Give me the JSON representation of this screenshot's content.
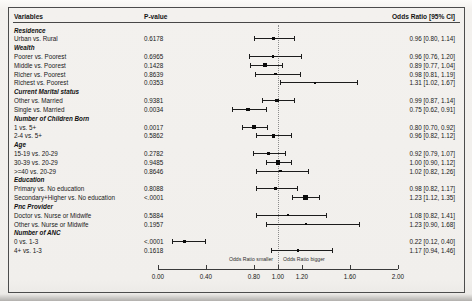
{
  "chart_data": {
    "type": "forest",
    "title": "",
    "columns": [
      "Variables",
      "P-value",
      "Odds Ratio [95% CI]"
    ],
    "xlim": [
      0.0,
      2.0
    ],
    "ref_line": 1.0,
    "grid": false,
    "axis_ticks": [
      {
        "value": 0.0,
        "label": "0.00"
      },
      {
        "value": 0.4,
        "label": "0.40"
      },
      {
        "value": 0.8,
        "label": "0.80"
      },
      {
        "value": 1.0,
        "label": "1.00"
      },
      {
        "value": 1.2,
        "label": "1.20"
      },
      {
        "value": 1.6,
        "label": "1.60"
      },
      {
        "value": 2.0,
        "label": "2.00"
      }
    ],
    "ref_labels": {
      "left": "Odds Ratio smaller",
      "right": "Odds Ratio bigger"
    },
    "rows": [
      {
        "type": "group",
        "label": "Residence"
      },
      {
        "type": "item",
        "label": "Urban vs. Rural",
        "p_value": "0.6178",
        "or": 0.96,
        "ci_low": 0.8,
        "ci_high": 1.14,
        "ci_text": "0.96 [0.80, 1.14]"
      },
      {
        "type": "group",
        "label": "Wealth"
      },
      {
        "type": "item",
        "label": "Poorer vs. Poorest",
        "p_value": "0.6965",
        "or": 0.96,
        "ci_low": 0.76,
        "ci_high": 1.2,
        "ci_text": "0.96 [0.76, 1.20]"
      },
      {
        "type": "item",
        "label": "Middle vs. Poorest",
        "p_value": "0.1428",
        "or": 0.89,
        "ci_low": 0.77,
        "ci_high": 1.04,
        "ci_text": "0.89 [0.77, 1.04]"
      },
      {
        "type": "item",
        "label": "Richer vs. Poorest",
        "p_value": "0.8639",
        "or": 0.98,
        "ci_low": 0.81,
        "ci_high": 1.19,
        "ci_text": "0.98 [0.81, 1.19]"
      },
      {
        "type": "item",
        "label": "Richest vs. Poorest",
        "p_value": "0.0353",
        "or": 1.31,
        "ci_low": 1.02,
        "ci_high": 1.67,
        "ci_text": "1.31 [1.02, 1.67]"
      },
      {
        "type": "group",
        "label": "Current Marital status"
      },
      {
        "type": "item",
        "label": "Other vs. Married",
        "p_value": "0.9381",
        "or": 0.99,
        "ci_low": 0.87,
        "ci_high": 1.14,
        "ci_text": "0.99 [0.87, 1.14]"
      },
      {
        "type": "item",
        "label": "Single vs. Married",
        "p_value": "0.0034",
        "or": 0.75,
        "ci_low": 0.62,
        "ci_high": 0.91,
        "ci_text": "0.75 [0.62, 0.91]"
      },
      {
        "type": "group",
        "label": "Number of Children Born"
      },
      {
        "type": "item",
        "label": "1 vs. 5+",
        "p_value": "0.0017",
        "or": 0.8,
        "ci_low": 0.7,
        "ci_high": 0.92,
        "ci_text": "0.80 [0.70, 0.92]"
      },
      {
        "type": "item",
        "label": "2-4 vs. 5+",
        "p_value": "0.5862",
        "or": 0.96,
        "ci_low": 0.82,
        "ci_high": 1.12,
        "ci_text": "0.96 [0.82, 1.12]"
      },
      {
        "type": "group",
        "label": "Age"
      },
      {
        "type": "item",
        "label": "15-19 vs. 20-29",
        "p_value": "0.2782",
        "or": 0.92,
        "ci_low": 0.79,
        "ci_high": 1.07,
        "ci_text": "0.92 [0.79, 1.07]"
      },
      {
        "type": "item",
        "label": "30-39 vs. 20-29",
        "p_value": "0.9485",
        "or": 1.0,
        "ci_low": 0.9,
        "ci_high": 1.12,
        "ci_text": "1.00 [0.90, 1.12]"
      },
      {
        "type": "item",
        "label": ">=40 vs. 20-29",
        "p_value": "0.8646",
        "or": 1.02,
        "ci_low": 0.82,
        "ci_high": 1.26,
        "ci_text": "1.02 [0.82, 1.26]"
      },
      {
        "type": "group",
        "label": "Education"
      },
      {
        "type": "item",
        "label": "Primary vs. No education",
        "p_value": "0.8088",
        "or": 0.98,
        "ci_low": 0.82,
        "ci_high": 1.17,
        "ci_text": "0.98 [0.82, 1.17]"
      },
      {
        "type": "item",
        "label": "Secondary+Higher vs. No education",
        "p_value": "<.0001",
        "or": 1.23,
        "ci_low": 1.12,
        "ci_high": 1.35,
        "ci_text": "1.23 [1.12, 1.35]"
      },
      {
        "type": "group",
        "label": "Pnc Provider"
      },
      {
        "type": "item",
        "label": "Doctor vs. Nurse or Midwife",
        "p_value": "0.5884",
        "or": 1.08,
        "ci_low": 0.82,
        "ci_high": 1.41,
        "ci_text": "1.08 [0.82, 1.41]"
      },
      {
        "type": "item",
        "label": "Other vs. Nurse or Midwife",
        "p_value": "0.1957",
        "or": 1.23,
        "ci_low": 0.9,
        "ci_high": 1.68,
        "ci_text": "1.23 [0.90, 1.68]"
      },
      {
        "type": "group",
        "label": "Number of ANC"
      },
      {
        "type": "item",
        "label": "0 vs. 1-3",
        "p_value": "<.0001",
        "or": 0.22,
        "ci_low": 0.12,
        "ci_high": 0.4,
        "ci_text": "0.22 [0.12, 0.40]"
      },
      {
        "type": "item",
        "label": "4+ vs. 1-3",
        "p_value": "0.1618",
        "or": 1.17,
        "ci_low": 0.94,
        "ci_high": 1.46,
        "ci_text": "1.17 [0.94, 1.46]"
      }
    ]
  }
}
